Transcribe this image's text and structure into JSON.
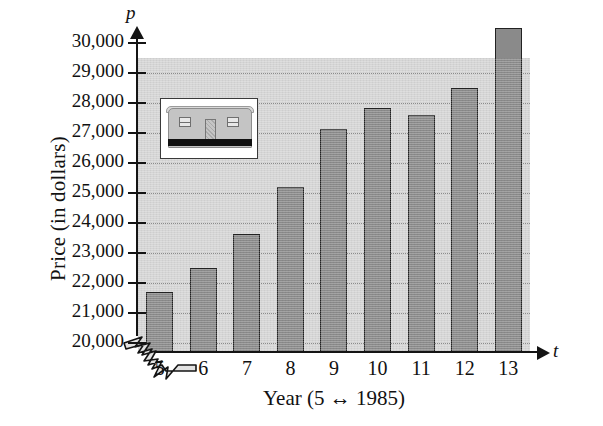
{
  "chart_data": {
    "type": "bar",
    "title": "",
    "xlabel": "Year (5 ↔ 1985)",
    "ylabel": "Price (in dollars)",
    "x_variable_symbol": "t",
    "y_variable_symbol": "p",
    "categories": [
      "5",
      "6",
      "7",
      "8",
      "9",
      "10",
      "11",
      "12",
      "13"
    ],
    "values": [
      21700,
      22500,
      23650,
      25200,
      27150,
      27850,
      27600,
      28500,
      30500
    ],
    "ylim": [
      20000,
      31000
    ],
    "y_axis_broken": true,
    "y_tick_labels": [
      "20,000",
      "21,000",
      "22,000",
      "23,000",
      "24,000",
      "25,000",
      "26,000",
      "27,000",
      "28,000",
      "29,000",
      "30,000"
    ],
    "y_tick_values": [
      20000,
      21000,
      22000,
      23000,
      24000,
      25000,
      26000,
      27000,
      28000,
      29000,
      30000
    ],
    "grid": true,
    "legend": "none",
    "bar_color": "#8a8a8a",
    "bar_border_color": "#222222",
    "plot_background_color": "#d5d5d5",
    "axis_color": "#141414",
    "gridline_color": "#6d6d6d"
  },
  "inset": {
    "name": "manufactured-home-photo",
    "description": "mobile home"
  }
}
